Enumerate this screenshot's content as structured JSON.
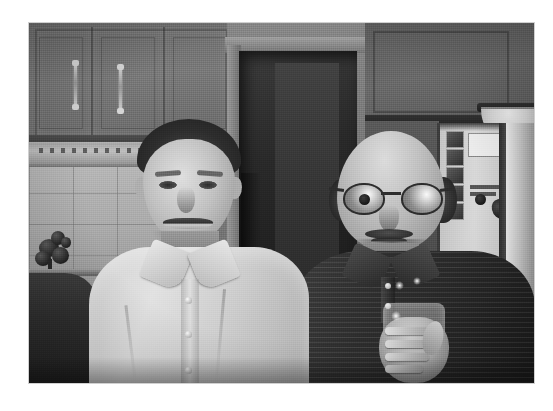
{
  "page": {
    "background_color": "#ffffff",
    "width": 553,
    "height": 411,
    "caption": ""
  },
  "photo": {
    "kind": "scanned-photograph",
    "subject": "two men standing in a kitchen",
    "rendering": "grayscale halftone photocopy",
    "frame": {
      "x": 29,
      "y": 23,
      "width": 505,
      "height": 360
    },
    "border_color": "#787878"
  },
  "scene": {
    "setting": "kitchen interior",
    "background": {
      "upper_cabinets_left": "wood upper cabinets with vertical pull handles",
      "range_hood": "range hood with vent slots under the cabinets",
      "tile_backsplash": "square tile backsplash with grout lines",
      "counter_object": "dark flower arrangement on counter",
      "doorway": "dark open doorway behind the men",
      "upper_cabinets_right": "dark upper cabinets on the right wall",
      "bowl": "light ceramic bowl on top of the right cabinets",
      "refrigerator": "refrigerator with photos, notes and a magnet on the door"
    },
    "people": [
      {
        "id": "man-left",
        "position": "left",
        "hair": "dark, combed",
        "expression": "smiling",
        "clothing": "light button-down long sleeve shirt",
        "details": "open collar, visible shirt buttons down the placket"
      },
      {
        "id": "man-right",
        "position": "right",
        "hair": "bald on top with dark hair at the sides",
        "eyewear": "round wire-rim eyeglasses",
        "facial_hair": "mustache and light beard",
        "expression": "smiling",
        "clothing": "dark ribbed knit polo shirt",
        "holding": "a drinking glass in the right hand"
      }
    ]
  },
  "colors": {
    "paper": "#ffffff",
    "photo_mid_gray": "#7a7a7a",
    "photo_dark": "#1b1b1b",
    "photo_light": "#e6e6e6",
    "cabinet_gray": "#6e6e6e",
    "tile_gray": "#b1b1b1",
    "shirt_light": "#dcdcdc",
    "shirt_dark": "#262626"
  }
}
